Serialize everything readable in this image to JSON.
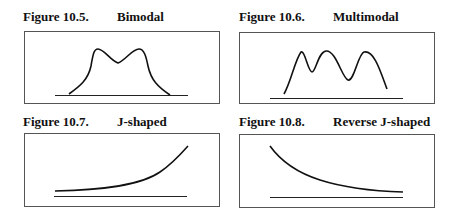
{
  "figures": [
    {
      "number": "Figure 10.5.",
      "name": "Bimodal",
      "shape": "bimodal"
    },
    {
      "number": "Figure 10.6.",
      "name": "Multimodal",
      "shape": "multimodal"
    },
    {
      "number": "Figure 10.7.",
      "name": "J-shaped",
      "shape": "j-shaped"
    },
    {
      "number": "Figure 10.8.",
      "name": "Reverse J-shaped",
      "shape": "reverse-j-shaped"
    }
  ],
  "colors": {
    "line": "#111111",
    "box": "#555555",
    "background": "#ffffff"
  }
}
